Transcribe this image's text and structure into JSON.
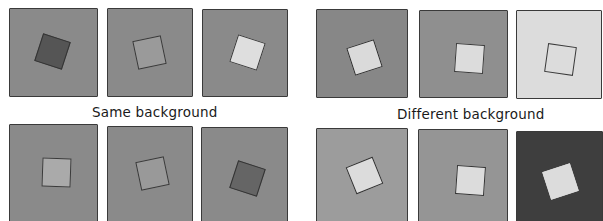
{
  "figure": {
    "captions": {
      "left": "Same background",
      "right": "Different background"
    },
    "groups": [
      {
        "name": "same-background-top",
        "panels": [
          {
            "background": "#8a8a8a",
            "square": "#555555",
            "border": "#333333",
            "rotation": 18
          },
          {
            "background": "#8a8a8a",
            "square": "#9a9a9a",
            "border": "#3a3a3a",
            "rotation": -12
          },
          {
            "background": "#8a8a8a",
            "square": "#dedede",
            "border": "#3a3a3a",
            "rotation": 18
          }
        ]
      },
      {
        "name": "different-background-top",
        "panels": [
          {
            "background": "#878787",
            "square": "#dadada",
            "border": "#2e2e2e",
            "rotation": -18
          },
          {
            "background": "#8f8f8f",
            "square": "#dcdcdc",
            "border": "#3a3a3a",
            "rotation": 4
          },
          {
            "background": "#dcdcdc",
            "square": "#dcdcdc",
            "border": "#3a3a3a",
            "rotation": 8
          }
        ]
      },
      {
        "name": "same-background-bottom",
        "panels": [
          {
            "background": "#8a8a8a",
            "square": "#aaaaaa",
            "border": "#3a3a3a",
            "rotation": 2
          },
          {
            "background": "#8a8a8a",
            "square": "#999999",
            "border": "#3a3a3a",
            "rotation": -12
          },
          {
            "background": "#8a8a8a",
            "square": "#656565",
            "border": "#333333",
            "rotation": 18
          }
        ]
      },
      {
        "name": "different-background-bottom",
        "panels": [
          {
            "background": "#9c9c9c",
            "square": "#dcdcdc",
            "border": "#333333",
            "rotation": -22
          },
          {
            "background": "#959595",
            "square": "#dcdcdc",
            "border": "#333333",
            "rotation": 4
          },
          {
            "background": "#3e3e3e",
            "square": "#dcdcdc",
            "border": "#dcdcdc",
            "rotation": -18
          }
        ]
      }
    ]
  }
}
